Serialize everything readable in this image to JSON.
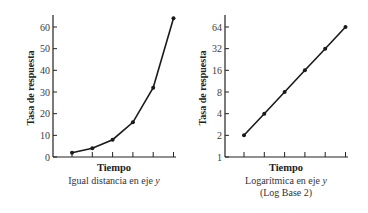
{
  "chart_data": [
    {
      "type": "line",
      "title": "",
      "xlabel": "Tiempo",
      "ylabel": "Tasa de respuesta",
      "caption": "Igual distancia en eje y",
      "caption_lines": [
        "Igual distancia en eje ",
        "y"
      ],
      "y_scale": "linear",
      "ylim": [
        0,
        64
      ],
      "y_ticks": [
        0,
        10,
        20,
        30,
        40,
        50,
        60
      ],
      "x_ticks_count": 6,
      "x": [
        1,
        2,
        3,
        4,
        5,
        6
      ],
      "values": [
        2,
        4,
        8,
        16,
        32,
        64
      ],
      "grid": false,
      "legend": null,
      "line_color": "#1a1a1a"
    },
    {
      "type": "line",
      "title": "",
      "xlabel": "Tiempo",
      "ylabel": "Tasa de respuesta",
      "caption": "Logarítmica en eje y (Log Base 2)",
      "caption_lines": [
        "Logarítmica en eje ",
        "y",
        "(Log Base 2)"
      ],
      "y_scale": "log2",
      "ylim": [
        1,
        64
      ],
      "y_ticks": [
        1,
        2,
        4,
        8,
        16,
        32,
        64
      ],
      "x_ticks_count": 6,
      "x": [
        1,
        2,
        3,
        4,
        5,
        6
      ],
      "values": [
        2,
        4,
        8,
        16,
        32,
        64
      ],
      "grid": false,
      "legend": null,
      "line_color": "#1a1a1a"
    }
  ]
}
